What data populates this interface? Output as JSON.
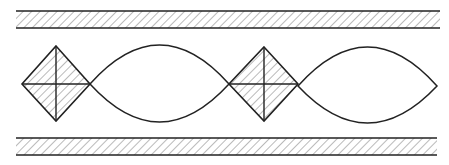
{
  "diagram": {
    "stroke_color": "#222222",
    "hatch_color": "#555555",
    "background": "#ffffff",
    "walls": [
      {
        "name": "top-wall",
        "x1": 16,
        "x2": 440,
        "y_top": 11,
        "y_bottom": 28
      },
      {
        "name": "bottom-wall",
        "x1": 16,
        "x2": 437,
        "y_top": 138,
        "y_bottom": 155
      }
    ],
    "diamonds": [
      {
        "name": "diamond-1",
        "cx": 56,
        "cy": 84,
        "left": 22,
        "right": 90,
        "top": 46,
        "bottom": 121
      },
      {
        "name": "diamond-2",
        "cx": 264,
        "cy": 84,
        "left": 229,
        "right": 298,
        "top": 47,
        "bottom": 121
      }
    ],
    "lenses": [
      {
        "name": "lens-1",
        "left": 90,
        "right": 229,
        "top": 45,
        "bottom": 122,
        "cy": 84
      },
      {
        "name": "lens-2",
        "left": 298,
        "right": 437,
        "top": 47,
        "bottom": 123,
        "cy": 86
      }
    ]
  }
}
